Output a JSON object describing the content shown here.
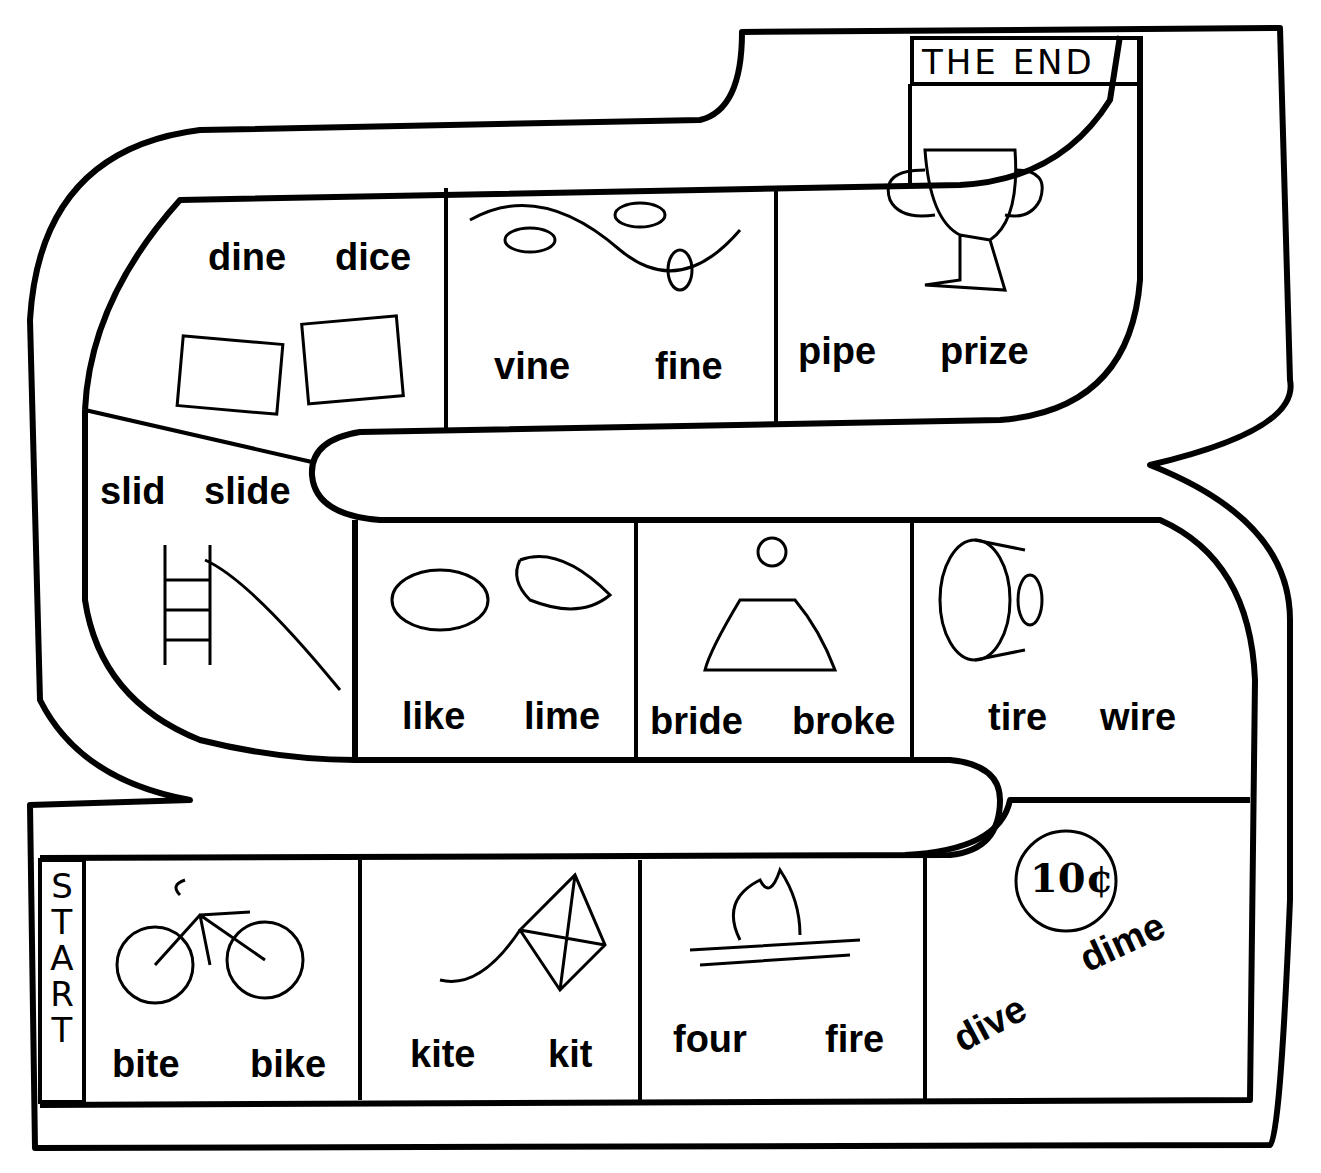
{
  "board": {
    "end_label": "THE END",
    "start_label": "START",
    "start_letters": [
      "S",
      "T",
      "A",
      "R",
      "T"
    ]
  },
  "spaces": [
    {
      "id": "bike",
      "words": [
        "bite",
        "bike"
      ],
      "picture": "bicycle-icon"
    },
    {
      "id": "kite",
      "words": [
        "kite",
        "kit"
      ],
      "picture": "kite-icon"
    },
    {
      "id": "fire",
      "words": [
        "four",
        "fire"
      ],
      "picture": "campfire-icon"
    },
    {
      "id": "dime",
      "words": [
        "dive",
        "dime"
      ],
      "picture": "dime-coin-icon",
      "coin_text": "10¢"
    },
    {
      "id": "tire",
      "words": [
        "tire",
        "wire"
      ],
      "picture": "tire-icon"
    },
    {
      "id": "bride",
      "words": [
        "bride",
        "broke"
      ],
      "picture": "bride-icon"
    },
    {
      "id": "lime",
      "words": [
        "like",
        "lime"
      ],
      "picture": "lemon-lime-icon"
    },
    {
      "id": "slide",
      "words": [
        "slid",
        "slide"
      ],
      "picture": "slide-icon"
    },
    {
      "id": "dice",
      "words": [
        "dine",
        "dice"
      ],
      "picture": "dice-icon"
    },
    {
      "id": "vine",
      "words": [
        "vine",
        "fine"
      ],
      "picture": "vine-icon"
    },
    {
      "id": "prize",
      "words": [
        "pipe",
        "prize"
      ],
      "picture": "trophy-icon"
    }
  ]
}
